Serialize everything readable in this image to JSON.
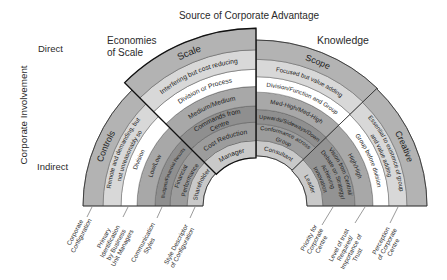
{
  "title": "Source of Corporate Advantage",
  "vertical_axis": {
    "label": "Corporate Involvement",
    "top": "Direct",
    "bottom": "Indirect"
  },
  "groups": {
    "economies_of_scale": [
      "Economies",
      "of Scale"
    ],
    "knowledge": "Knowledge"
  },
  "sectors": [
    {
      "name": "Controls",
      "cells": [
        {
          "lines": [
            "Shareholder"
          ]
        },
        {
          "lines": [
            "Financial",
            "Performance"
          ]
        },
        {
          "lines": [
            "Budgets/Financial Results"
          ]
        },
        {
          "lines": [
            "Low/Low"
          ]
        },
        {
          "lines": [
            "Division"
          ]
        },
        {
          "lines": [
            "Remote and demanding, but",
            "not unreasonably so"
          ]
        },
        {
          "lines": [
            "Controls"
          ]
        }
      ]
    },
    {
      "name": "Scale",
      "cells": [
        {
          "lines": [
            "Manager"
          ]
        },
        {
          "lines": [
            "Cost Reduction"
          ]
        },
        {
          "lines": [
            "Commands from",
            "Centre"
          ]
        },
        {
          "lines": [
            "Medium/Medium"
          ]
        },
        {
          "lines": [
            "Division or Process"
          ]
        },
        {
          "lines": [
            "Interfering but cost reducing"
          ]
        },
        {
          "lines": [
            "Scale"
          ]
        }
      ]
    },
    {
      "name": "Scope",
      "cells": [
        {
          "lines": [
            "Consultant"
          ]
        },
        {
          "lines": [
            "Conformance across",
            "Group"
          ]
        },
        {
          "lines": [
            "Upwards/Sideways/Down"
          ]
        },
        {
          "lines": [
            "Med-High/Med-High"
          ]
        },
        {
          "lines": [
            "Division/Function and Group"
          ]
        },
        {
          "lines": [
            "Focused but value adding"
          ]
        },
        {
          "lines": [
            "Scope"
          ]
        }
      ]
    },
    {
      "name": "Creative",
      "cells": [
        {
          "lines": [
            "Leader"
          ]
        },
        {
          "lines": [
            "Vision from Central/",
            "Debate on Strategy/",
            "Achieving",
            "Innovation"
          ]
        },
        {
          "lines": [
            "High/High"
          ]
        },
        {
          "lines": [
            "Group before division"
          ]
        },
        {
          "lines": [
            "Essential to existence of group",
            "and value adding"
          ]
        },
        {
          "lines": [
            "Creative"
          ]
        }
      ]
    }
  ],
  "dimensions": [
    {
      "lines": [
        "Corporate",
        "Configuration"
      ]
    },
    {
      "lines": [
        "Primary",
        "Identification",
        "by Business",
        "Unit Managers"
      ]
    },
    {
      "lines": [
        "Communication",
        "Styles"
      ]
    },
    {
      "lines": [
        "Style Descriptor",
        "of Configuration"
      ]
    },
    {
      "lines": [
        "Priority for",
        "Corporate",
        "Centre"
      ]
    },
    {
      "lines": [
        "Level of trust",
        "Required/",
        "Importance of",
        "Trust"
      ]
    },
    {
      "lines": [
        "Perception",
        "of Corporate",
        "Centre"
      ]
    }
  ]
}
